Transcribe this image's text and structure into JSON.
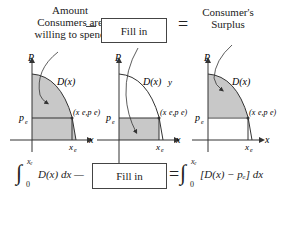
{
  "top": {
    "left_label": [
      "Amount",
      "Consumers are",
      "willing to spend"
    ],
    "minus": "—",
    "fill_in_top": "Fill in",
    "equals": "=",
    "right_label": [
      "Consumer's",
      "Surplus"
    ]
  },
  "graphs": [
    {
      "axis_y": "P",
      "axis_x": "x",
      "curve": "D(x)",
      "point": "(xₑ,pₑ)",
      "pe": "pₑ",
      "xe": "xₑ",
      "shading": "under curve from 0 to xₑ"
    },
    {
      "axis_y": "P",
      "axis_x": "x",
      "curve": "D(x)",
      "point": "(xₑ,pₑ)",
      "pe": "pₑ",
      "xe": "xₑ",
      "extra": "y",
      "shading": "rectangle below pₑ"
    },
    {
      "axis_y": "P",
      "axis_x": "x",
      "curve": "D(x)",
      "point": "(xₑ,pₑ)",
      "pe": "pₑ",
      "xe": "xₑ",
      "shading": "between curve and pₑ"
    }
  ],
  "bottom": {
    "integral_left": "D(x) dx —",
    "int_upper": "xₑ",
    "int_lower": "0",
    "fill_in_bottom": "Fill in",
    "equals": "=",
    "integral_right": "[D(x) − pₑ] dx"
  }
}
